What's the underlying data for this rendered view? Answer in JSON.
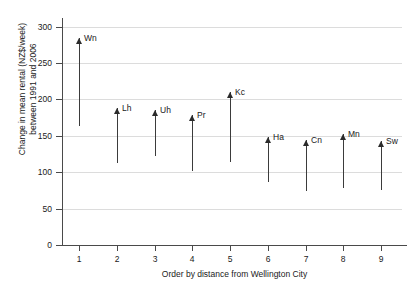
{
  "chart_data": {
    "type": "bar",
    "title": "",
    "xlabel": "Order by distance from Wellington City",
    "ylabel": "Change in mean rental (NZ$/week) between 1991 and 2006",
    "ylabel_line1": "Change in mean rental (NZ$/week)",
    "ylabel_line2": "between 1991 and 2006",
    "categories": [
      "1",
      "2",
      "3",
      "4",
      "5",
      "6",
      "7",
      "8",
      "9"
    ],
    "x": [
      1,
      2,
      3,
      4,
      5,
      6,
      7,
      8,
      9
    ],
    "point_labels": [
      "Wn",
      "Lh",
      "Uh",
      "Pr",
      "Kc",
      "Ha",
      "Cn",
      "Mn",
      "Sw"
    ],
    "series": [
      {
        "name": "1991 mean rental (arrow tail)",
        "values": [
          164,
          112,
          123,
          101,
          114,
          86,
          74,
          78,
          75
        ]
      },
      {
        "name": "2006 mean rental (arrow head)",
        "values": [
          285,
          188,
          186,
          178,
          210,
          148,
          144,
          152,
          143
        ]
      }
    ],
    "change_values": [
      121,
      76,
      63,
      77,
      96,
      62,
      70,
      74,
      68
    ],
    "xlim": [
      0.55,
      9.55
    ],
    "ylim": [
      0,
      312
    ],
    "yticks": [
      0,
      50,
      100,
      150,
      200,
      250,
      300
    ],
    "ytick_labels": [
      "0",
      "50",
      "100",
      "150",
      "200",
      "250",
      "300"
    ],
    "xticks": [
      1,
      2,
      3,
      4,
      5,
      6,
      7,
      8,
      9
    ],
    "xtick_labels": [
      "1",
      "2",
      "3",
      "4",
      "5",
      "6",
      "7",
      "8",
      "9"
    ],
    "grid": "horizontal",
    "legend": "none",
    "arrow_color": "#3b3b3b",
    "grid_color": "#dcdcdc",
    "axis_color": "#4a4a4a"
  }
}
